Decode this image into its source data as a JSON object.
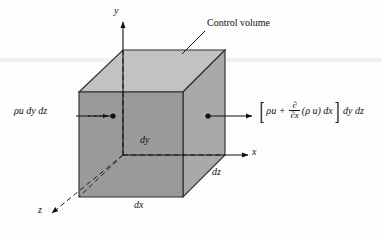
{
  "figure": {
    "name": "control-volume-mass-flux-diagram",
    "background_color": "#fdfdfd",
    "line_color": "#111111"
  },
  "cube": {
    "front_face_color": "#9a9a9a",
    "side_face_color": "#a9a9a9",
    "top_face_color": "#c2c2c2",
    "edge_color": "#2b2b2b"
  },
  "axes": {
    "y_label": "y",
    "x_label": "x",
    "z_label": "z"
  },
  "dimensions": {
    "dy_label": "dy",
    "dx_label": "dx",
    "dz_label": "dz"
  },
  "annotations": {
    "control_volume_label": "Control volume"
  },
  "flux": {
    "influx_label": "ρu dy dz",
    "efflux": {
      "open_bracket": "[",
      "first_term": "ρu +",
      "derivative_numerator": "∂",
      "derivative_denominator": "∂x",
      "product_term": "(ρ u) dx",
      "close_bracket": "]",
      "trailing_term": "dy dz"
    }
  }
}
